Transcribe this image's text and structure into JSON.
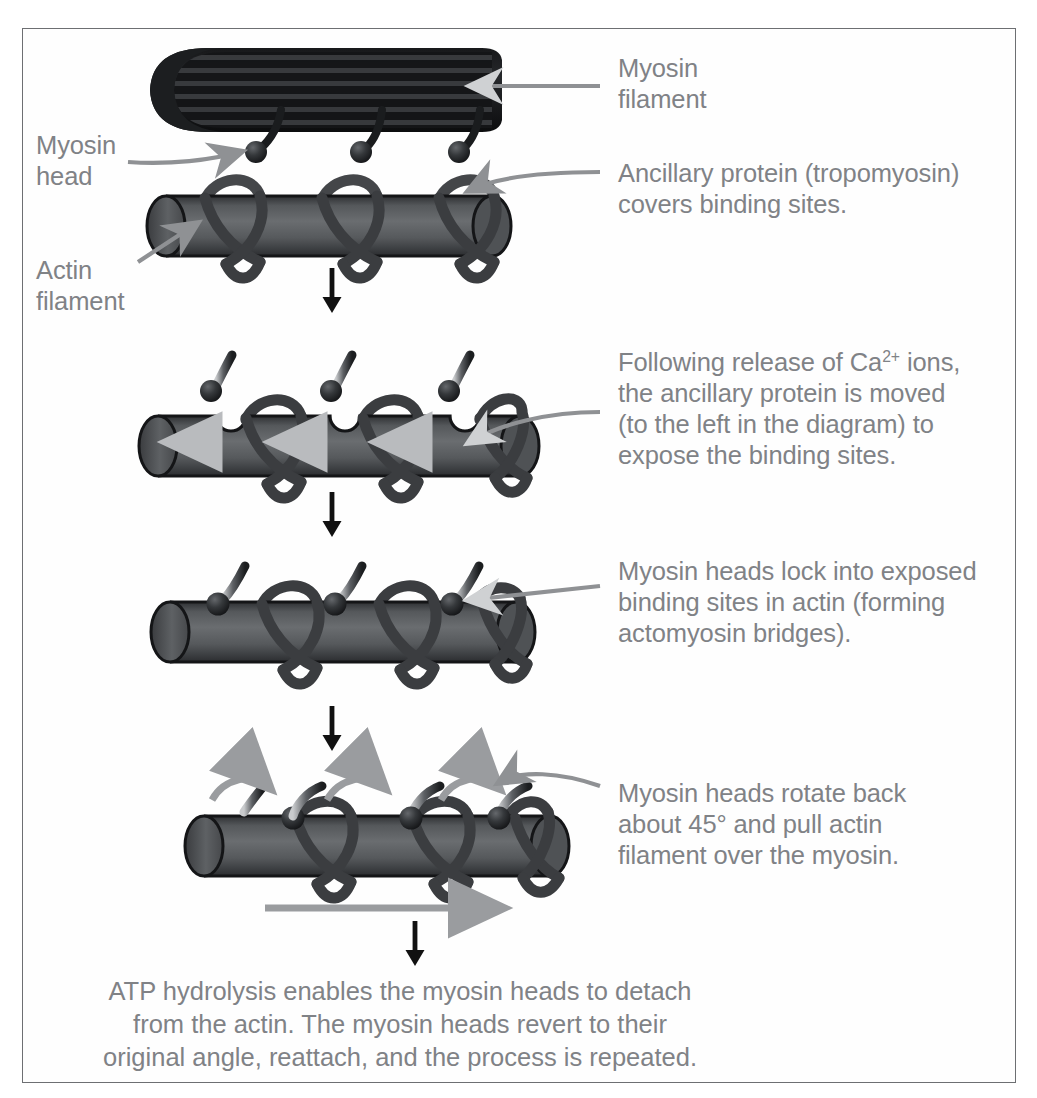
{
  "figure": {
    "title_visible": false,
    "border_color": "#6d6f72",
    "background": "#ffffff",
    "text_color": "#808286",
    "arrow_color_black": "#111111",
    "leader_color": "#8f9194",
    "actin_color": "#595b5e",
    "actin_edge": "#151617",
    "tropomyosin_color": "#3b3d40",
    "myosin_filament_color": "#121314",
    "myosin_head_color": "#2a2c2f",
    "motion_arrow_color": "#9a9c9f"
  },
  "labels": {
    "myosin_filament": "Myosin\nfilament",
    "myosin_head": "Myosin\nhead",
    "actin_filament": "Actin\nfilament",
    "ancillary_protein": "Ancillary protein (tropomyosin)\ncovers binding sites.",
    "step2_pre": "Following release of Ca",
    "step2_charge": "2+",
    "step2_post": " ions,\nthe ancillary protein is moved\n(to the left in the diagram) to\nexpose the binding sites.",
    "step3": "Myosin heads lock into exposed\nbinding sites in actin (forming\nactomyosin bridges).",
    "step4": "Myosin heads rotate back\nabout 45° and pull actin\nfilament over the myosin.",
    "final_caption": "ATP hydrolysis enables the myosin heads to detach\nfrom the actin. The myosin heads revert to their\noriginal angle, reattach, and the process is repeated."
  },
  "icons": {
    "step_arrow": "arrow-down-icon",
    "leader_arrow": "leader-arrow-icon",
    "slide_arrow": "slide-right-arrow-icon",
    "shift_arrow": "shift-left-arrow-icon",
    "rotate_arrow": "rotate-arrow-icon"
  },
  "panels": [
    {
      "id": "panel-1",
      "name": "relaxed-state",
      "description": "Myosin filament with three myosin heads above an actin filament wrapped by tropomyosin covering binding sites."
    },
    {
      "id": "panel-2",
      "name": "calcium-release",
      "description": "Tropomyosin shifted left exposing binding sites; myosin heads detached above actin."
    },
    {
      "id": "panel-3",
      "name": "cross-bridge-formation",
      "description": "Myosin heads locked into exposed binding sites on actin."
    },
    {
      "id": "panel-4",
      "name": "power-stroke",
      "description": "Myosin heads rotated back about 45 degrees pulling the actin filament to the right."
    }
  ],
  "step_arrows": [
    {
      "x": 332,
      "y": 268
    },
    {
      "x": 332,
      "y": 492
    },
    {
      "x": 332,
      "y": 706
    },
    {
      "x": 415,
      "y": 921
    }
  ]
}
